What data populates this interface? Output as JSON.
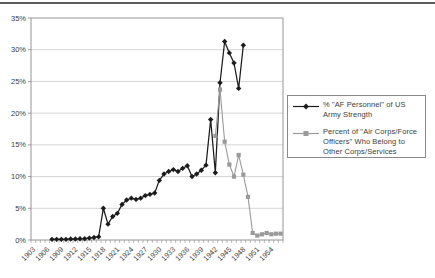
{
  "page": {
    "background": "#ffffff",
    "top_rule_color": "#5c5c5c"
  },
  "chart_data": {
    "type": "line",
    "title": "",
    "xlabel": "",
    "ylabel": "",
    "grid": true,
    "legend_position": "right",
    "x_axis": {
      "start": 1903,
      "end": 1956,
      "tick_labels": [
        "1903",
        "1906",
        "1909",
        "1912",
        "1915",
        "1918",
        "1921",
        "1924",
        "1927",
        "1930",
        "1933",
        "1936",
        "1939",
        "1942",
        "1945",
        "1948",
        "1951",
        "1954"
      ],
      "label_interval_years": 3
    },
    "y_axis": {
      "min": 0,
      "max": 35,
      "step": 5,
      "tick_labels": [
        "0%",
        "5%",
        "10%",
        "15%",
        "20%",
        "25%",
        "30%",
        "35%"
      ]
    },
    "series": [
      {
        "name": "% \"AF Personnel\" of US Army Strength",
        "marker": "diamond",
        "color": "#1c1c1c",
        "points": [
          [
            1907,
            0.1
          ],
          [
            1908,
            0.1
          ],
          [
            1909,
            0.1
          ],
          [
            1910,
            0.1
          ],
          [
            1911,
            0.15
          ],
          [
            1912,
            0.15
          ],
          [
            1913,
            0.2
          ],
          [
            1914,
            0.2
          ],
          [
            1915,
            0.3
          ],
          [
            1916,
            0.4
          ],
          [
            1917,
            0.5
          ],
          [
            1918,
            5.0
          ],
          [
            1919,
            2.5
          ],
          [
            1920,
            3.7
          ],
          [
            1921,
            4.2
          ],
          [
            1922,
            5.6
          ],
          [
            1923,
            6.3
          ],
          [
            1924,
            6.6
          ],
          [
            1925,
            6.4
          ],
          [
            1926,
            6.6
          ],
          [
            1927,
            7.0
          ],
          [
            1928,
            7.2
          ],
          [
            1929,
            7.4
          ],
          [
            1930,
            9.4
          ],
          [
            1931,
            10.4
          ],
          [
            1932,
            10.8
          ],
          [
            1933,
            11.1
          ],
          [
            1934,
            10.8
          ],
          [
            1935,
            11.3
          ],
          [
            1936,
            11.7
          ],
          [
            1937,
            10.0
          ],
          [
            1938,
            10.4
          ],
          [
            1939,
            11.0
          ],
          [
            1940,
            11.8
          ],
          [
            1941,
            19.0
          ],
          [
            1942,
            10.6
          ],
          [
            1943,
            24.8
          ],
          [
            1944,
            31.3
          ],
          [
            1945,
            29.5
          ],
          [
            1946,
            27.9
          ],
          [
            1947,
            23.9
          ],
          [
            1948,
            30.7
          ]
        ]
      },
      {
        "name": "Percent of \"Air Corps/Force Officers\" Who Belong to Other Corps/Services",
        "marker": "square",
        "color": "#9a9a9a",
        "points": [
          [
            1942,
            16.4
          ],
          [
            1943,
            23.7
          ],
          [
            1944,
            15.5
          ],
          [
            1945,
            11.9
          ],
          [
            1946,
            10.0
          ],
          [
            1947,
            13.4
          ],
          [
            1948,
            10.3
          ],
          [
            1949,
            6.8
          ],
          [
            1950,
            1.1
          ],
          [
            1951,
            0.7
          ],
          [
            1952,
            0.9
          ],
          [
            1953,
            1.1
          ],
          [
            1954,
            0.9
          ],
          [
            1955,
            1.0
          ],
          [
            1956,
            1.0
          ]
        ]
      }
    ],
    "plot_style": {
      "grid_color": "#c9c9c9",
      "axis_color": "#8a8a8a",
      "tick_label_color": "#3d3d3d",
      "plot_background": "#ffffff"
    }
  }
}
